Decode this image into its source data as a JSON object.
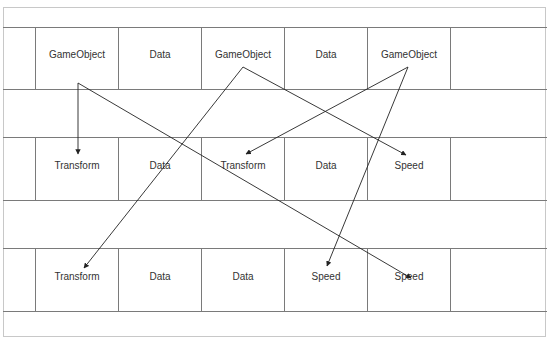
{
  "diagram": {
    "rows": [
      {
        "cells": [
          "",
          "GameObject",
          "Data",
          "GameObject",
          "Data",
          "GameObject",
          ""
        ]
      },
      {
        "cells": [
          "",
          "Transform",
          "Data",
          "Transform",
          "Data",
          "Speed",
          ""
        ]
      },
      {
        "cells": [
          "",
          "Transform",
          "Data",
          "Data",
          "Speed",
          "Speed",
          ""
        ]
      }
    ],
    "arrows": [
      {
        "from": "row1.GameObject#1",
        "to": "row2.Transform#1"
      },
      {
        "from": "row1.GameObject#1",
        "to": "row3.Speed#2"
      },
      {
        "from": "row1.GameObject#2",
        "to": "row3.Transform#1"
      },
      {
        "from": "row1.GameObject#2",
        "to": "row2.Speed#1"
      },
      {
        "from": "row1.GameObject#3",
        "to": "row2.Transform#2"
      },
      {
        "from": "row1.GameObject#3",
        "to": "row3.Speed#1"
      }
    ],
    "colors": {
      "line": "#7a7a7a",
      "arrow": "#222222",
      "text": "#333333"
    }
  }
}
